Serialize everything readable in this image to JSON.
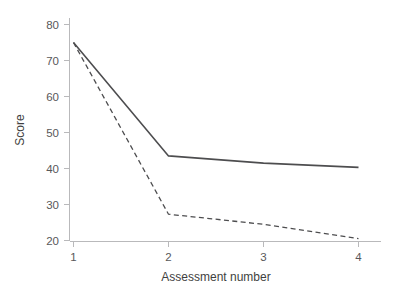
{
  "chart_data": {
    "type": "line",
    "title": "",
    "xlabel": "Assessment number",
    "ylabel": "Score",
    "x": [
      1,
      2,
      3,
      4
    ],
    "xticks": [
      "1",
      "2",
      "3",
      "4"
    ],
    "yticks": [
      "20",
      "30",
      "40",
      "50",
      "60",
      "70",
      "80"
    ],
    "xlim": [
      1,
      4
    ],
    "ylim": [
      18,
      81
    ],
    "grid": false,
    "legend": "none",
    "series": [
      {
        "name": "solid",
        "style": "solid",
        "color": "#4d4d4f",
        "values": [
          75.0,
          43.5,
          41.5,
          40.3
        ]
      },
      {
        "name": "dashed",
        "style": "dashed",
        "color": "#4d4d4f",
        "values": [
          75.0,
          27.3,
          24.5,
          20.5
        ]
      }
    ]
  },
  "axes": {
    "y_title": "Score",
    "x_title": "Assessment number",
    "y_tick_labels": [
      "80",
      "70",
      "60",
      "50",
      "40",
      "30",
      "20"
    ],
    "x_tick_labels": [
      "1",
      "2",
      "3",
      "4"
    ]
  },
  "colors": {
    "background": "#ffffff",
    "axis": "#b9b9bb",
    "tick_label": "#58585a",
    "axis_title": "#3f3f41",
    "line": "#4d4d4f"
  }
}
